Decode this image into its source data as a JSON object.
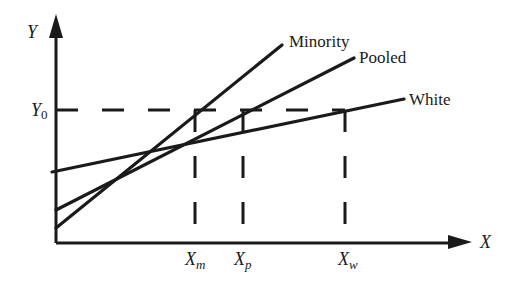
{
  "figure": {
    "type": "diagram",
    "axes": {
      "y_label": "Y",
      "x_label": "X",
      "y_level_label": "Y",
      "y_level_sub": "0"
    },
    "lines": [
      {
        "name": "Minority",
        "label": "Minority"
      },
      {
        "name": "Pooled",
        "label": "Pooled"
      },
      {
        "name": "White",
        "label": "White"
      }
    ],
    "x_markers": [
      {
        "label": "X",
        "sub": "m"
      },
      {
        "label": "X",
        "sub": "p"
      },
      {
        "label": "X",
        "sub": "w"
      }
    ]
  }
}
